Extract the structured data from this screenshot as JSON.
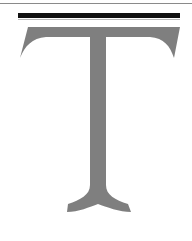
{
  "glyph": {
    "character": "T",
    "style": "serif capital letter",
    "color": "#7f7f7f"
  },
  "decorations": {
    "top_rule_color": "#8a8a8a",
    "bar_color": "#111111"
  }
}
